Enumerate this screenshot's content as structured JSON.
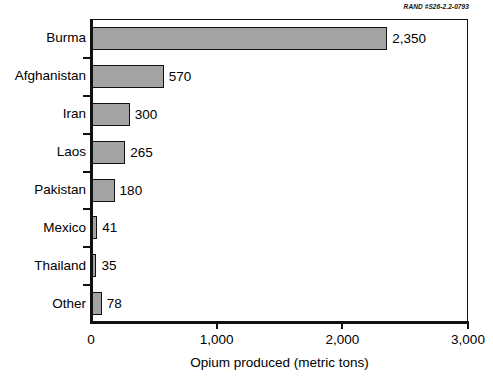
{
  "source_credit": "RAND #S26-2.2-0793",
  "chart_data": {
    "type": "bar",
    "orientation": "horizontal",
    "title": "",
    "xlabel": "Opium produced (metric tons)",
    "ylabel": "",
    "xlim": [
      0,
      3000
    ],
    "xticks": [
      0,
      1000,
      2000,
      3000
    ],
    "xtick_labels": [
      "0",
      "1,000",
      "2,000",
      "3,000"
    ],
    "grid": false,
    "legend": null,
    "bar_color": "#a3a3a3",
    "bar_edge_color": "#111111",
    "categories": [
      "Burma",
      "Afghanistan",
      "Iran",
      "Laos",
      "Pakistan",
      "Mexico",
      "Thailand",
      "Other"
    ],
    "values": [
      2350,
      570,
      300,
      265,
      180,
      41,
      35,
      78
    ],
    "value_labels": [
      "2,350",
      "570",
      "300",
      "265",
      "180",
      "41",
      "35",
      "78"
    ]
  }
}
